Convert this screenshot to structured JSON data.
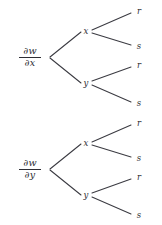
{
  "figure": {
    "type": "diagram",
    "subtype": "chain-rule-dependency-tree",
    "background_color": "#ffffff",
    "line_color": "#3b3b42",
    "text_color": "#2e2e34"
  },
  "trees": [
    {
      "id": "tree-dw-dx",
      "root": {
        "numerator": "∂w",
        "denominator": "∂x"
      },
      "level1": [
        {
          "label": "x"
        },
        {
          "label": "y"
        }
      ],
      "leaves": [
        {
          "label": "r"
        },
        {
          "label": "s"
        },
        {
          "label": "r"
        },
        {
          "label": "s"
        }
      ]
    },
    {
      "id": "tree-dw-dy",
      "root": {
        "numerator": "∂w",
        "denominator": "∂y"
      },
      "level1": [
        {
          "label": "x"
        },
        {
          "label": "y"
        }
      ],
      "leaves": [
        {
          "label": "r"
        },
        {
          "label": "s"
        },
        {
          "label": "r"
        },
        {
          "label": "s"
        }
      ]
    }
  ]
}
